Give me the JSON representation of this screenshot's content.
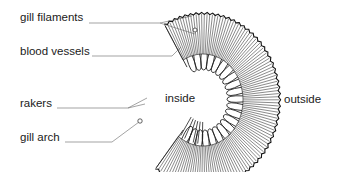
{
  "diagram": {
    "type": "labelled anatomical diagram",
    "labels": {
      "gill_filaments": "gill filaments",
      "blood_vessels": "blood vessels",
      "rakers": "rakers",
      "gill_arch": "gill arch",
      "inside": "inside",
      "outside": "outside"
    },
    "colors": {
      "line": "#2a2a2a",
      "leader": "#555555",
      "text": "#1a1a1a",
      "background": "#ffffff"
    }
  }
}
